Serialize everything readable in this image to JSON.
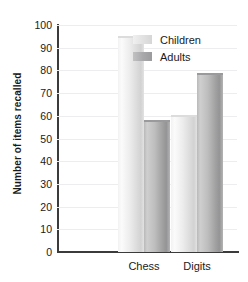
{
  "chart_data": {
    "type": "bar",
    "title": "",
    "xlabel": "",
    "ylabel": "Number of items recalled",
    "categories": [
      "Chess",
      "Digits"
    ],
    "series": [
      {
        "name": "Children",
        "values": [
          95,
          60.5
        ],
        "color": "#e6e6e7"
      },
      {
        "name": "Adults",
        "values": [
          58,
          79
        ],
        "color": "#a8a8aa"
      }
    ],
    "ylim": [
      0,
      100
    ],
    "yticks": [
      0,
      10,
      20,
      30,
      40,
      50,
      60,
      70,
      80,
      90,
      100
    ],
    "ytick_labels": [
      "0",
      "10",
      "20",
      "30",
      "40",
      "50",
      "60",
      "70",
      "80",
      "90",
      "100"
    ],
    "grid": true,
    "legend_position": "top-right"
  },
  "legend": {
    "items": [
      {
        "label": "Children",
        "swatch": "children-swatch"
      },
      {
        "label": "Adults",
        "swatch": "adults-swatch"
      }
    ]
  }
}
